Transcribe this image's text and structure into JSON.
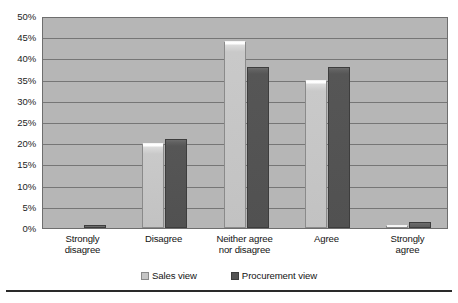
{
  "chart_data": {
    "type": "bar",
    "title": "",
    "subtitle": "",
    "xlabel": "",
    "ylabel": "",
    "categories": [
      "Strongly\ndisagree",
      "Disagree",
      "Neither agree\nnor disagree",
      "Agree",
      "Strongly\nagree"
    ],
    "series": [
      {
        "name": "Sales view",
        "values": [
          0,
          20,
          44,
          35,
          0.5
        ],
        "color": "#c6c6c6"
      },
      {
        "name": "Procurement view",
        "values": [
          0.5,
          21,
          38,
          38,
          1.5
        ],
        "color": "#545454"
      }
    ],
    "ylim": [
      0,
      50
    ],
    "ytick_labels": [
      "0%",
      "5%",
      "10%",
      "15%",
      "20%",
      "25%",
      "30%",
      "35%",
      "40%",
      "45%",
      "50%"
    ],
    "ytick_values": [
      0,
      5,
      10,
      15,
      20,
      25,
      30,
      35,
      40,
      45,
      50
    ],
    "grid": true,
    "grid_axis": "y",
    "legend_position": "bottom",
    "plot_background": "#b6b6b6",
    "axis_color": "#6e6e6e"
  },
  "legend": {
    "entries": [
      {
        "label": "Sales view"
      },
      {
        "label": "Procurement view"
      }
    ]
  }
}
